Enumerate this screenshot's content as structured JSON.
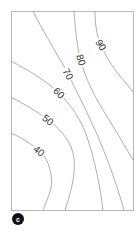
{
  "chart_data": {
    "type": "contour",
    "title": "",
    "xlabel": "",
    "ylabel": "",
    "panel_label": "c",
    "grid": false,
    "legend": null,
    "frame": {
      "x": 11,
      "y": 11,
      "width": 122,
      "height": 199
    },
    "levels": [
      40,
      50,
      60,
      70,
      80,
      90
    ],
    "contours": [
      {
        "level": 40,
        "label": "40",
        "label_pos": [
          39,
          151
        ],
        "label_angle": 38,
        "path": "M11,133 C22,138 33,145 41,152 C50,162 53,178 51,188 C49,197 45,204 43,210"
      },
      {
        "level": 50,
        "label": "50",
        "label_pos": [
          48,
          120
        ],
        "label_angle": 38,
        "path": "M11,97 C24,104 38,112 50,121 C62,131 72,143 74,158 C76,175 70,195 65,210"
      },
      {
        "level": 60,
        "label": "60",
        "label_pos": [
          59,
          93
        ],
        "label_angle": 45,
        "path": "M11,61 C28,70 45,80 58,92 C70,104 82,120 88,140 C95,162 100,185 103,210"
      },
      {
        "level": 70,
        "label": "70",
        "label_pos": [
          68,
          74
        ],
        "label_angle": 62,
        "path": "M33,11 C42,30 55,50 66,70 C76,90 86,110 96,132 C106,155 116,182 124,210"
      },
      {
        "level": 80,
        "label": "80",
        "label_pos": [
          81,
          60
        ],
        "label_angle": 72,
        "path": "M74,11 C75,25 76,40 80,58 C85,78 95,98 108,118 C118,134 127,150 133,160"
      },
      {
        "level": 90,
        "label": "90",
        "label_pos": [
          101,
          45
        ],
        "label_angle": 58,
        "path": "M95,11 C95,22 96,32 100,43 C106,58 116,72 125,82 C128,86 131,89 133,92"
      }
    ]
  },
  "badge": {
    "label": "c",
    "cx": 18,
    "cy": 219,
    "r": 6
  }
}
